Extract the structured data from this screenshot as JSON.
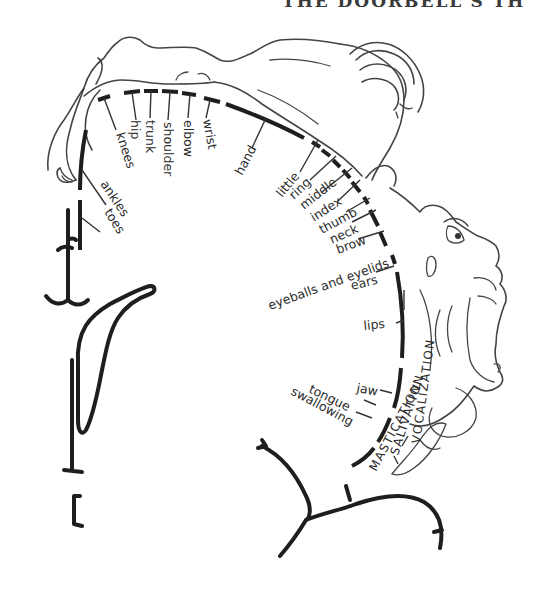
{
  "header": {
    "title_fragment": "THE DOORBELL'S TH"
  },
  "diagram": {
    "type": "motor homunculus",
    "body_labels": [
      "toes",
      "ankles",
      "knees",
      "hip",
      "trunk",
      "shoulder",
      "elbow",
      "wrist",
      "hand"
    ],
    "finger_labels": [
      "little",
      "ring",
      "middle",
      "index",
      "thumb"
    ],
    "head_labels": [
      "neck",
      "brow",
      "eyeballs and eyelids",
      "ears",
      "lips",
      "jaw",
      "tongue",
      "swallowing"
    ],
    "function_labels": {
      "vocalization": "VOCALIZATION",
      "salivation": "SALIVATION",
      "mastication": "MASTICATION"
    },
    "labels": {
      "toes": "toes",
      "ankles": "ankles",
      "knees": "knees",
      "hip": "hip",
      "trunk": "trunk",
      "shoulder": "shoulder",
      "elbow": "elbow",
      "wrist": "wrist",
      "hand": "hand",
      "little": "little",
      "ring": "ring",
      "middle": "middle",
      "index": "index",
      "thumb": "thumb",
      "neck": "neck",
      "brow": "brow",
      "eyeballs": "eyeballs and eyelids",
      "ears": "ears",
      "lips": "lips",
      "jaw": "jaw",
      "tongue": "tongue",
      "swallowing": "swallowing",
      "vocalization": "VOCALIZATION",
      "salivation": "SALIVATION",
      "mastication": "MASTICATION"
    }
  }
}
